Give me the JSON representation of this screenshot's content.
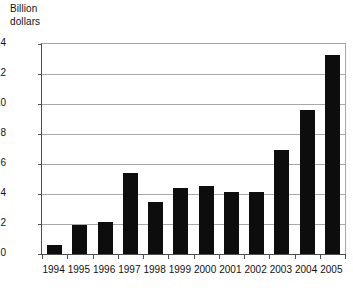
{
  "chart_data": {
    "type": "bar",
    "title": "",
    "subtitle": "",
    "xlabel": "",
    "ylabel": "Billion dollars",
    "ylabel_lines": [
      "Billion",
      "dollars"
    ],
    "categories": [
      "1994",
      "1995",
      "1996",
      "1997",
      "1998",
      "1999",
      "2000",
      "2001",
      "2002",
      "2003",
      "2004",
      "2005"
    ],
    "values": [
      0.6,
      1.95,
      2.15,
      5.4,
      3.5,
      4.4,
      4.55,
      4.15,
      4.15,
      6.95,
      9.6,
      13.3
    ],
    "ylim": [
      0,
      14
    ],
    "ytick_values": [
      0,
      2,
      4,
      6,
      8,
      10,
      12,
      14
    ],
    "ytick_labels": [
      "0",
      "2",
      "4",
      "6",
      "8",
      "10",
      "12",
      "14"
    ],
    "grid": "horizontal",
    "legend": "none",
    "bar_color": "#0d0d0d",
    "gridline_color": "#a8a8a8",
    "axis_color": "#4d4d4d",
    "background_color": "#ffffff",
    "annotations": []
  }
}
